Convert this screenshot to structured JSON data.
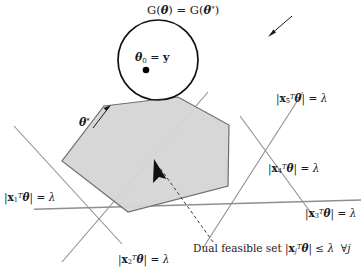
{
  "figure": {
    "title_annotation": "G(θ) = G(θ*)",
    "width": 361,
    "height": 277,
    "background_color": "#ffffff",
    "line_color": "#8c8c8c",
    "polygon_fill": "#d4d4d4",
    "polygon_stroke": "#6e6e6e",
    "circle_stroke": "#111111",
    "text_color": "#1a1a1a"
  },
  "labels": {
    "g_equality": {
      "prefix": "G(",
      "theta": "θ",
      "mid": ") = G(",
      "theta_star": "θ",
      "star": "*",
      "suffix": ")"
    },
    "theta_zero": {
      "theta": "θ",
      "subscript": "0",
      "equals": " = ",
      "y": "y"
    },
    "theta_star_point": {
      "theta": "θ",
      "star": "*"
    },
    "constraint_5": {
      "open": "|",
      "x": "x",
      "subscript": "5",
      "transpose": "T",
      "theta": "θ",
      "close": "|",
      "equals": " = ",
      "lambda": "λ"
    },
    "constraint_4": {
      "open": "|",
      "x": "x",
      "subscript": "4",
      "transpose": "T",
      "theta": "θ",
      "close": "|",
      "equals": " = ",
      "lambda": "λ"
    },
    "constraint_3": {
      "open": "|",
      "x": "x",
      "subscript": "3",
      "transpose": "T",
      "theta": "θ",
      "close": "|",
      "equals": " = ",
      "lambda": "λ"
    },
    "constraint_1": {
      "open": "|",
      "x": "x",
      "subscript": "1",
      "transpose": "T",
      "theta": "θ",
      "close": "|",
      "equals": " = ",
      "lambda": "λ"
    },
    "constraint_2": {
      "open": "|",
      "x": "x",
      "subscript": "2",
      "transpose": "T",
      "theta": "θ",
      "close": "|",
      "equals": " = ",
      "lambda": "λ"
    },
    "dual_feasible_set": {
      "text": "Dual feasible set ",
      "open": "|",
      "x": "x",
      "subscript": "j",
      "transpose": "T",
      "theta": "θ",
      "close": "|",
      "leq": " ≤ ",
      "lambda": "λ",
      "forall": "∀",
      "j": "j"
    }
  },
  "geometry": {
    "circle": {
      "cx": 158,
      "cy": 60,
      "r": 40
    },
    "center_dot": {
      "cx": 146,
      "cy": 70,
      "r": 3.2
    },
    "polygon_points": "104,106 178,97 229,125 228,186 128,212 62,161",
    "constraint_lines": [
      {
        "name": "line-1",
        "x1": 18,
        "y1": 131,
        "x2": 118,
        "y2": 239
      },
      {
        "name": "line-2",
        "x1": 66,
        "y1": 257,
        "x2": 204,
        "y2": 96
      },
      {
        "name": "line-3",
        "x1": 36,
        "y1": 209,
        "x2": 361,
        "y2": 200
      },
      {
        "name": "line-4",
        "x1": 207,
        "y1": 241,
        "x2": 300,
        "y2": 96
      },
      {
        "name": "line-5",
        "x1": 310,
        "y1": 211,
        "x2": 244,
        "y2": 121
      }
    ],
    "arrow_to_circle": {
      "x1": 290,
      "y1": 18,
      "x2": 268,
      "y2": 37
    },
    "arrow_to_theta_star": {
      "x1": 94,
      "y1": 127,
      "x2": 110,
      "y2": 106
    },
    "dashed_arrow": {
      "x1": 212,
      "y1": 243,
      "x2": 155,
      "y2": 160
    }
  }
}
